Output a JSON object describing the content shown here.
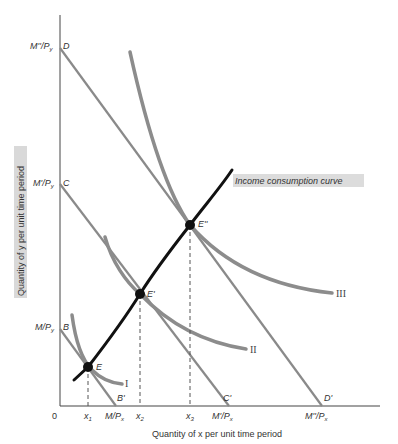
{
  "diagram": {
    "type": "economics-income-consumption",
    "axes": {
      "x_label": "Quantity of x per unit time period",
      "y_label": "Quantity of y per unit time period",
      "origin_label": "0"
    },
    "y_intercepts": [
      {
        "point": "B",
        "value_label": "M/P",
        "value_sub": "y"
      },
      {
        "point": "C",
        "value_label": "M'/P",
        "value_sub": "y"
      },
      {
        "point": "D",
        "value_label": "M''/P",
        "value_sub": "y"
      }
    ],
    "x_intercepts": [
      {
        "point": "B'",
        "value_label": "M/P",
        "value_sub": "x"
      },
      {
        "point": "C'",
        "value_label": "M'/P",
        "value_sub": "x"
      },
      {
        "point": "D'",
        "value_label": "M''/P",
        "value_sub": "x"
      }
    ],
    "x_ticks": [
      {
        "label": "x",
        "sub": "1"
      },
      {
        "label": "x",
        "sub": "2"
      },
      {
        "label": "x",
        "sub": "3"
      }
    ],
    "equilibria": [
      {
        "label": "E"
      },
      {
        "label": "E'"
      },
      {
        "label": "E''"
      }
    ],
    "indifference_curves": [
      {
        "label": "I"
      },
      {
        "label": "II"
      },
      {
        "label": "III"
      }
    ],
    "income_consumption_curve_label": "Income consumption curve",
    "colors": {
      "budget_line": "#8a8a8a",
      "indifference_curve": "#8c8c8c",
      "icc": "#111111",
      "axis": "#444444",
      "label_highlight": "#d6d6d6"
    }
  }
}
